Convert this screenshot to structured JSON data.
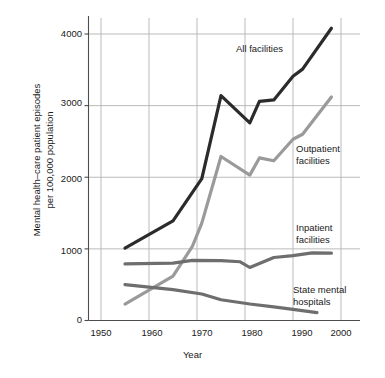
{
  "chart_data": {
    "type": "line",
    "title": "",
    "xlabel": "Year",
    "ylabel": "Mental health–care patient episodes\nper 100,000 population",
    "ylabel_line1": "Mental health–care patient episodes",
    "ylabel_line2": "per 100,000 population",
    "xlim": [
      1948,
      2002
    ],
    "ylim": [
      0,
      4300
    ],
    "xticks": [
      1950,
      1960,
      1970,
      1980,
      1990,
      2000
    ],
    "xtick_labels": [
      "1950",
      "1960",
      "1970",
      "1980",
      "1990",
      "2000"
    ],
    "yticks": [
      0,
      1000,
      2000,
      3000,
      4000
    ],
    "ytick_labels": [
      "0",
      "1000",
      "2000",
      "3000",
      "4000"
    ],
    "grid": true,
    "grid_color": "#b3b3b3",
    "legend": "inline-annotations",
    "series": [
      {
        "name": "All facilities",
        "color": "#2b2b2b",
        "width": 3.2,
        "label_x": 1983,
        "label_y": 3700,
        "points": [
          [
            1955,
            1010
          ],
          [
            1965,
            1390
          ],
          [
            1971,
            1980
          ],
          [
            1975,
            3140
          ],
          [
            1981,
            2760
          ],
          [
            1983,
            3060
          ],
          [
            1986,
            3080
          ],
          [
            1990,
            3410
          ],
          [
            1992,
            3510
          ],
          [
            1998,
            4080
          ]
        ]
      },
      {
        "name": "Outpatient facilities",
        "color": "#9a9a9a",
        "width": 3.2,
        "label_x": 1986,
        "label_y": 2520,
        "points": [
          [
            1955,
            230
          ],
          [
            1965,
            620
          ],
          [
            1969,
            1030
          ],
          [
            1971,
            1360
          ],
          [
            1975,
            2290
          ],
          [
            1981,
            2030
          ],
          [
            1983,
            2270
          ],
          [
            1986,
            2230
          ],
          [
            1990,
            2530
          ],
          [
            1992,
            2600
          ],
          [
            1998,
            3120
          ]
        ]
      },
      {
        "name": "Inpatient facilities",
        "color": "#6e6e6e",
        "width": 3.2,
        "label_x": 1986,
        "label_y": 1310,
        "points": [
          [
            1955,
            790
          ],
          [
            1965,
            800
          ],
          [
            1969,
            840
          ],
          [
            1975,
            835
          ],
          [
            1979,
            820
          ],
          [
            1981,
            740
          ],
          [
            1986,
            880
          ],
          [
            1990,
            905
          ],
          [
            1994,
            945
          ],
          [
            1998,
            940
          ]
        ]
      },
      {
        "name": "State mental hospitals",
        "color": "#6e6e6e",
        "width": 3.2,
        "label_x": 1986,
        "label_y": 570,
        "points": [
          [
            1955,
            500
          ],
          [
            1965,
            430
          ],
          [
            1971,
            370
          ],
          [
            1975,
            290
          ],
          [
            1981,
            230
          ],
          [
            1986,
            190
          ],
          [
            1990,
            155
          ],
          [
            1995,
            110
          ]
        ]
      }
    ],
    "annotations": [
      {
        "text_line1": "All facilities",
        "text_line2": ""
      },
      {
        "text_line1": "Outpatient",
        "text_line2": "facilities"
      },
      {
        "text_line1": "Inpatient",
        "text_line2": "facilities"
      },
      {
        "text_line1": "State mental",
        "text_line2": "hospitals"
      }
    ]
  },
  "axes": {
    "x_axis_title": "Year",
    "y_axis_title_line1": "Mental health–care patient episodes",
    "y_axis_title_line2": "per 100,000 population",
    "xtick_labels": [
      "1950",
      "1960",
      "1970",
      "1980",
      "1990",
      "2000"
    ],
    "ytick_labels": [
      "4000",
      "3000",
      "2000",
      "1000",
      "0"
    ]
  },
  "annotations": {
    "all_facilities": "All facilities",
    "outpatient_l1": "Outpatient",
    "outpatient_l2": "facilities",
    "inpatient_l1": "Inpatient",
    "inpatient_l2": "facilities",
    "state_l1": "State mental",
    "state_l2": "hospitals"
  }
}
